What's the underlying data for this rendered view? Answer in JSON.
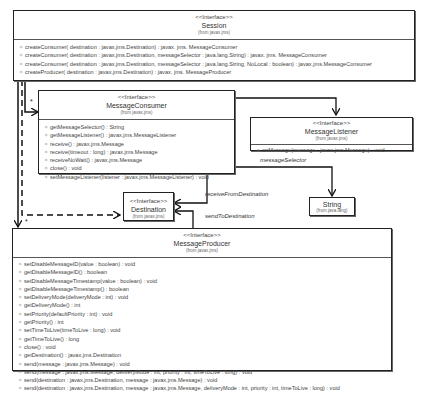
{
  "diagram": {
    "type": "UML class diagram",
    "classes": {
      "session": {
        "stereotype": "<<Interface>>",
        "name": "Session",
        "from": "(from javax.jms)",
        "operations": [
          "createConsumer( destination : javax.jms.Destination) : javax. jms. MessageConsumer",
          "createConsumer( destination : javax.jms.Destination, messageSelector : java.lang.String) : javax. jms. MessageConsumer",
          "createConsumer( destination : javax.jms.Destination, messageSelector : java.lang.String, NoLocal : boolean) : javax.jms.MessageConsumer",
          "createProducer( destination : javax.jms.Destination) : javax. jms. MessageProducer"
        ]
      },
      "consumer": {
        "stereotype": "<<Interface>>",
        "name": "MessageConsumer",
        "from": "(from javax.jms)",
        "operations": [
          "getMessageSelector() : String",
          "getMessageListener() : javax.jms.MessageListener",
          "receive() : javax.jms.Message",
          "receive(timeout : long) : javax.jms.Message",
          "receiveNoWait() : javax.jms.Message",
          "close() : void",
          "setMessageListener(listener : javax.jms.MessageListener) : void"
        ]
      },
      "listener": {
        "stereotype": "<<Interface>>",
        "name": "MessageListener",
        "from": "(from javax.jms)",
        "operations": [
          "onMessage(message : javax.jms.Message) : void"
        ]
      },
      "destination": {
        "stereotype": "<<Interface>>",
        "name": "Destination",
        "from": "(from javax.jms)"
      },
      "string": {
        "name": "String",
        "from": "(from java.lang)"
      },
      "producer": {
        "stereotype": "<<Interface>>",
        "name": "MessageProducer",
        "from": "(from javax.jms)",
        "operations": [
          "setDisableMessageID(value : boolean) : void",
          "getDisableMessageID() : boolean",
          "setDisableMessageTimestamp(value : boolean) : void",
          "getDisableMessageTimestamp() : boolean",
          "setDeliveryMode(deliveryMode : int) : void",
          "getDeliveryMode() : int",
          "setPriority(defaultPriority : int) : void",
          "getPriority() : int",
          "setTimeToLive(timeToLive : long) : void",
          "getTimeToLive() : long",
          "close() : void",
          "getDestination() : javax.jms.Destination",
          "send(message : javax.jms.Message) : void",
          "send(message : javax.jms.Message, deliveryMode : int, priority : int, timeToLive : long) : void",
          "send(destination : javax.jms.Destination, message : javax.jms.Message) : void",
          "send(destination : javax.jms.Destination, message : javax.jms.Message, deliveryMode : int, priority : int, timeToLive : long) : void"
        ]
      }
    },
    "associations": {
      "message_selector": "messageSelector",
      "receive_from_destination": "receiveFromDestination",
      "send_to_destination": "sendToDestination",
      "multiplicity_consumer": "*",
      "multiplicity_producer": "*"
    },
    "operation_icon": "method-icon"
  }
}
